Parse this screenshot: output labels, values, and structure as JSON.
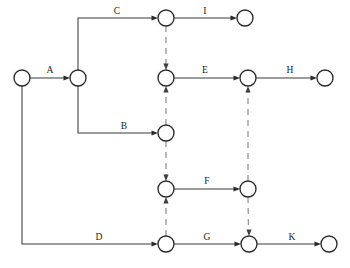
{
  "diagram": {
    "kind": "activity-on-arrow-network",
    "title": "",
    "canvas": {
      "width": 350,
      "height": 268
    },
    "colors": {
      "background": "#ffffff",
      "solid_edge": "#3a3a3a",
      "dashed_edge": "#8d8d8d",
      "node_stroke": "#2b2b2b",
      "node_fill": "#ffffff",
      "label_text": "#1c1c1c"
    },
    "node_radius": 8,
    "nodes": [
      {
        "id": "n-start",
        "name": "start-node",
        "x": 22,
        "y": 78,
        "label": ""
      },
      {
        "id": "n-a-end",
        "name": "node-after-a",
        "x": 78,
        "y": 78,
        "label": ""
      },
      {
        "id": "n-c-end",
        "name": "node-after-c",
        "x": 166,
        "y": 18,
        "label": ""
      },
      {
        "id": "n-i-end",
        "name": "node-after-i",
        "x": 245,
        "y": 18,
        "label": ""
      },
      {
        "id": "n-e-start",
        "name": "node-start-of-e",
        "x": 166,
        "y": 78,
        "label": ""
      },
      {
        "id": "n-e-end",
        "name": "node-after-e",
        "x": 248,
        "y": 78,
        "label": ""
      },
      {
        "id": "n-h-end",
        "name": "node-after-h",
        "x": 325,
        "y": 78,
        "label": ""
      },
      {
        "id": "n-b-end",
        "name": "node-after-b",
        "x": 166,
        "y": 133,
        "label": ""
      },
      {
        "id": "n-f-start",
        "name": "node-start-of-f",
        "x": 166,
        "y": 189,
        "label": ""
      },
      {
        "id": "n-f-end",
        "name": "node-after-f",
        "x": 248,
        "y": 189,
        "label": ""
      },
      {
        "id": "n-d-end",
        "name": "node-after-d",
        "x": 166,
        "y": 244,
        "label": ""
      },
      {
        "id": "n-g-end",
        "name": "node-after-g",
        "x": 249,
        "y": 244,
        "label": ""
      },
      {
        "id": "n-k-end",
        "name": "node-after-k",
        "x": 329,
        "y": 244,
        "label": ""
      }
    ],
    "activities": [
      {
        "id": "act-a",
        "label": "A",
        "from": "n-start",
        "to": "n-a-end",
        "style": "solid",
        "label_x": 50,
        "label_y": 71
      },
      {
        "id": "act-c",
        "label": "C",
        "from": "n-a-end",
        "to": "n-c-end",
        "style": "solid",
        "label_x": 117,
        "label_y": 12
      },
      {
        "id": "act-i",
        "label": "I",
        "from": "n-c-end",
        "to": "n-i-end",
        "style": "solid",
        "label_x": 205,
        "label_y": 12
      },
      {
        "id": "act-e",
        "label": "E",
        "from": "n-e-start",
        "to": "n-e-end",
        "style": "solid",
        "label_x": 205,
        "label_y": 71
      },
      {
        "id": "act-h",
        "label": "H",
        "from": "n-e-end",
        "to": "n-h-end",
        "style": "solid",
        "label_x": 290,
        "label_y": 71
      },
      {
        "id": "act-b",
        "label": "B",
        "from": "n-a-end",
        "to": "n-b-end",
        "style": "solid",
        "label_x": 124,
        "label_y": 127
      },
      {
        "id": "act-f",
        "label": "F",
        "from": "n-f-start",
        "to": "n-f-end",
        "style": "solid",
        "label_x": 207,
        "label_y": 182
      },
      {
        "id": "act-d",
        "label": "D",
        "from": "n-start",
        "to": "n-d-end",
        "style": "solid",
        "label_x": 99,
        "label_y": 238
      },
      {
        "id": "act-g",
        "label": "G",
        "from": "n-d-end",
        "to": "n-g-end",
        "style": "solid",
        "label_x": 207,
        "label_y": 238
      },
      {
        "id": "act-k",
        "label": "K",
        "from": "n-g-end",
        "to": "n-k-end",
        "style": "solid",
        "label_x": 292,
        "label_y": 238
      }
    ],
    "dummy_links": [
      {
        "id": "dummy-1",
        "name": "dummy-c-to-e",
        "from": "n-c-end",
        "to": "n-e-start",
        "direction": "down",
        "x": 166,
        "y1": 18,
        "y2": 78
      },
      {
        "id": "dummy-2",
        "name": "dummy-b-to-e",
        "from": "n-b-end",
        "to": "n-e-start",
        "direction": "up",
        "x": 166,
        "y1": 133,
        "y2": 78
      },
      {
        "id": "dummy-3",
        "name": "dummy-b-to-f",
        "from": "n-b-end",
        "to": "n-f-start",
        "direction": "down",
        "x": 166,
        "y1": 133,
        "y2": 189
      },
      {
        "id": "dummy-4",
        "name": "dummy-d-to-f",
        "from": "n-d-end",
        "to": "n-f-start",
        "direction": "up",
        "x": 166,
        "y1": 244,
        "y2": 189
      },
      {
        "id": "dummy-5",
        "name": "dummy-f-to-e",
        "from": "n-f-end",
        "to": "n-e-end",
        "direction": "up",
        "x": 248,
        "y1": 189,
        "y2": 78
      },
      {
        "id": "dummy-6",
        "name": "dummy-f-to-g",
        "from": "n-f-end",
        "to": "n-g-end",
        "direction": "down",
        "x": 248,
        "y1": 189,
        "y2": 244
      }
    ],
    "legend": {
      "solid_meaning": "activity",
      "dashed_meaning": "dummy"
    }
  }
}
